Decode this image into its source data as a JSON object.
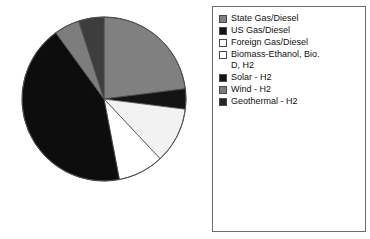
{
  "chart_data": {
    "type": "pie",
    "title": "",
    "xlabel": "",
    "ylabel": "",
    "grid": false,
    "legend_position": "right",
    "start_angle_deg": 0,
    "direction": "clockwise",
    "categories": [
      "State Gas/Diesel",
      "US Gas/Diesel",
      "Foreign Gas/Diesel",
      "Biomass-Ethanol, Bio. D, H2",
      "Solar - H2",
      "Wind - H2",
      "Geothermal - H2"
    ],
    "values": [
      23,
      4,
      11,
      9,
      43,
      5,
      5
    ],
    "colors": [
      "#808080",
      "#141414",
      "#f2f2f2",
      "#ffffff",
      "#0d0d0d",
      "#7d7d7d",
      "#3d3d3d"
    ]
  },
  "legend": {
    "items": [
      {
        "label": "State Gas/Diesel",
        "swatch": "#808080",
        "icon": "legend-swatch-gray"
      },
      {
        "label": "US Gas/Diesel",
        "swatch": "#141414",
        "icon": "legend-swatch-black"
      },
      {
        "label": "Foreign Gas/Diesel",
        "swatch": "#ffffff",
        "icon": "legend-swatch-white"
      },
      {
        "label": "Biomass-Ethanol, Bio.\nD, H2",
        "swatch": "#ffffff",
        "icon": "legend-swatch-white"
      },
      {
        "label": "Solar - H2",
        "swatch": "#141414",
        "icon": "legend-swatch-black"
      },
      {
        "label": "Wind - H2",
        "swatch": "#7d7d7d",
        "icon": "legend-swatch-gray"
      },
      {
        "label": "Geothermal - H2",
        "swatch": "#262626",
        "icon": "legend-swatch-dark"
      }
    ]
  },
  "pie": {
    "center_x": 96,
    "center_y": 91,
    "radius": 82,
    "outline": "#4d4d4d"
  }
}
